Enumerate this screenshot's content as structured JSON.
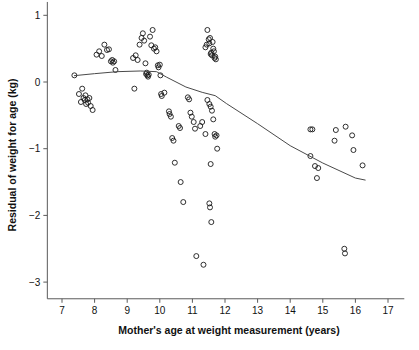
{
  "chart_data": {
    "type": "scatter",
    "title": "",
    "xlabel": "Mother's age at weight measurement (years)",
    "ylabel": "Residual of weight for age (kg)",
    "xlim": [
      6.55,
      17.5
    ],
    "ylim": [
      -3.25,
      1.2
    ],
    "xticks": [
      7,
      8,
      9,
      10,
      11,
      12,
      13,
      14,
      15,
      16,
      17
    ],
    "xtick_labels": [
      "7",
      "8",
      "9",
      "10",
      "11",
      "12",
      "13",
      "14",
      "15",
      "16",
      "17"
    ],
    "yticks": [
      1,
      0,
      -1,
      -2,
      -3
    ],
    "ytick_labels": [
      "1",
      "0",
      "−1",
      "−2",
      "−3"
    ],
    "grid": false,
    "legend": "none",
    "marker": "open-circle",
    "marker_color": "#1a1a1a",
    "line_color": "#4a4a4a",
    "points": [
      [
        7.38,
        0.1
      ],
      [
        7.52,
        -0.18
      ],
      [
        7.58,
        -0.3
      ],
      [
        7.62,
        -0.1
      ],
      [
        7.66,
        -0.24
      ],
      [
        7.7,
        -0.27
      ],
      [
        7.72,
        -0.2
      ],
      [
        7.74,
        -0.33
      ],
      [
        7.78,
        -0.26
      ],
      [
        7.8,
        -0.31
      ],
      [
        7.84,
        -0.24
      ],
      [
        7.88,
        -0.36
      ],
      [
        7.94,
        -0.42
      ],
      [
        8.06,
        0.41
      ],
      [
        8.14,
        0.46
      ],
      [
        8.22,
        0.39
      ],
      [
        8.3,
        0.56
      ],
      [
        8.38,
        0.48
      ],
      [
        8.44,
        0.49
      ],
      [
        8.5,
        0.31
      ],
      [
        8.54,
        0.33
      ],
      [
        8.56,
        0.29
      ],
      [
        8.6,
        0.31
      ],
      [
        8.64,
        0.18
      ],
      [
        9.18,
        0.36
      ],
      [
        9.22,
        -0.1
      ],
      [
        9.26,
        0.4
      ],
      [
        9.32,
        0.33
      ],
      [
        9.38,
        0.56
      ],
      [
        9.44,
        0.66
      ],
      [
        9.48,
        0.73
      ],
      [
        9.52,
        0.62
      ],
      [
        9.56,
        0.28
      ],
      [
        9.58,
        0.12
      ],
      [
        9.6,
        0.14
      ],
      [
        9.62,
        0.1
      ],
      [
        9.64,
        0.08
      ],
      [
        9.66,
        0.11
      ],
      [
        9.7,
        0.68
      ],
      [
        9.74,
        0.55
      ],
      [
        9.78,
        0.78
      ],
      [
        9.82,
        0.5
      ],
      [
        9.86,
        0.52
      ],
      [
        9.9,
        0.46
      ],
      [
        9.94,
        0.25
      ],
      [
        9.96,
        0.22
      ],
      [
        10.0,
        0.26
      ],
      [
        10.02,
        0.1
      ],
      [
        10.04,
        -0.18
      ],
      [
        10.06,
        -0.21
      ],
      [
        10.14,
        -0.16
      ],
      [
        10.28,
        -0.44
      ],
      [
        10.3,
        -0.48
      ],
      [
        10.34,
        -0.52
      ],
      [
        10.38,
        -0.84
      ],
      [
        10.42,
        -0.88
      ],
      [
        10.46,
        -1.21
      ],
      [
        10.58,
        -0.66
      ],
      [
        10.62,
        -0.69
      ],
      [
        10.64,
        -1.5
      ],
      [
        10.72,
        -1.8
      ],
      [
        10.86,
        -0.23
      ],
      [
        10.9,
        -0.26
      ],
      [
        10.94,
        -0.46
      ],
      [
        10.98,
        -0.52
      ],
      [
        11.04,
        -0.6
      ],
      [
        11.08,
        -0.7
      ],
      [
        11.12,
        -2.61
      ],
      [
        11.24,
        -0.66
      ],
      [
        11.3,
        -0.6
      ],
      [
        11.34,
        -2.74
      ],
      [
        11.4,
        0.52
      ],
      [
        11.44,
        0.56
      ],
      [
        11.46,
        0.78
      ],
      [
        11.5,
        0.64
      ],
      [
        11.52,
        0.58
      ],
      [
        11.54,
        0.66
      ],
      [
        11.56,
        0.42
      ],
      [
        11.58,
        0.44
      ],
      [
        11.6,
        0.4
      ],
      [
        11.62,
        0.6
      ],
      [
        11.64,
        0.5
      ],
      [
        11.66,
        0.46
      ],
      [
        11.68,
        0.36
      ],
      [
        11.7,
        0.38
      ],
      [
        11.72,
        0.34
      ],
      [
        11.46,
        -0.27
      ],
      [
        11.52,
        -0.33
      ],
      [
        11.56,
        -0.37
      ],
      [
        11.6,
        -0.43
      ],
      [
        11.64,
        -0.56
      ],
      [
        11.68,
        -0.78
      ],
      [
        11.7,
        -0.82
      ],
      [
        11.74,
        -0.8
      ],
      [
        11.76,
        -1.0
      ],
      [
        11.4,
        -0.78
      ],
      [
        11.56,
        -1.23
      ],
      [
        11.52,
        -1.82
      ],
      [
        11.54,
        -1.88
      ],
      [
        11.58,
        -2.1
      ],
      [
        14.62,
        -0.71
      ],
      [
        14.68,
        -0.71
      ],
      [
        14.62,
        -1.11
      ],
      [
        14.76,
        -1.26
      ],
      [
        14.86,
        -1.29
      ],
      [
        14.82,
        -1.44
      ],
      [
        15.66,
        -2.5
      ],
      [
        15.68,
        -2.57
      ],
      [
        15.9,
        -0.8
      ],
      [
        15.94,
        -1.02
      ],
      [
        15.4,
        -0.72
      ],
      [
        15.36,
        -0.88
      ],
      [
        15.7,
        -0.67
      ],
      [
        16.22,
        -1.25
      ]
    ],
    "fit_line": [
      [
        7.38,
        0.095
      ],
      [
        8.0,
        0.125
      ],
      [
        8.7,
        0.155
      ],
      [
        9.4,
        0.165
      ],
      [
        9.9,
        0.155
      ],
      [
        10.2,
        0.075
      ],
      [
        10.8,
        -0.075
      ],
      [
        11.3,
        -0.155
      ],
      [
        11.7,
        -0.205
      ],
      [
        12.05,
        -0.325
      ],
      [
        13.0,
        -0.625
      ],
      [
        14.0,
        -0.955
      ],
      [
        15.0,
        -1.215
      ],
      [
        16.0,
        -1.44
      ],
      [
        16.3,
        -1.47
      ]
    ]
  }
}
